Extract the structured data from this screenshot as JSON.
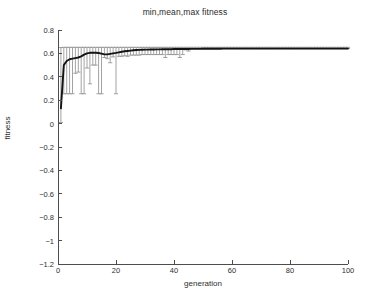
{
  "chart_data": {
    "type": "line",
    "title": "min,mean,max fitness",
    "xlabel": "generation",
    "ylabel": "fitness",
    "xlim": [
      0,
      100
    ],
    "ylim": [
      -1.2,
      0.8
    ],
    "xticks": [
      0,
      20,
      40,
      60,
      80,
      100
    ],
    "yticks": [
      0.8,
      0.6,
      0.4,
      0.2,
      0,
      -0.2,
      -0.4,
      -0.6,
      -0.8,
      -1,
      -1.2
    ],
    "ytick_labels": [
      "0.8",
      "0.6",
      "0.4",
      "0.2",
      "0",
      "−0.2",
      "−0.4",
      "−0.6",
      "−0.8",
      "−1",
      "−1.2"
    ],
    "xtick_labels": [
      "0",
      "20",
      "40",
      "60",
      "80",
      "100"
    ],
    "grid": false,
    "legend": null,
    "errorbar_marker": "+",
    "colors": {
      "mean_line": "#141414",
      "errorbar": "#8c8c8c",
      "axis": "#4d4d4d"
    },
    "x": [
      1,
      2,
      3,
      4,
      5,
      6,
      7,
      8,
      9,
      10,
      11,
      12,
      13,
      14,
      15,
      16,
      17,
      18,
      19,
      20,
      21,
      22,
      23,
      24,
      25,
      26,
      27,
      28,
      29,
      30,
      31,
      32,
      33,
      34,
      35,
      36,
      37,
      38,
      39,
      40,
      41,
      42,
      43,
      44,
      45,
      46,
      47,
      48,
      49,
      50,
      51,
      52,
      53,
      54,
      55,
      56,
      57,
      58,
      59,
      60,
      61,
      62,
      63,
      64,
      65,
      66,
      67,
      68,
      69,
      70,
      71,
      72,
      73,
      74,
      75,
      76,
      77,
      78,
      79,
      80,
      81,
      82,
      83,
      84,
      85,
      86,
      87,
      88,
      89,
      90,
      91,
      92,
      93,
      94,
      95,
      96,
      97,
      98,
      99,
      100
    ],
    "series": [
      {
        "name": "mean",
        "values": [
          0.13,
          0.5,
          0.535,
          0.55,
          0.555,
          0.56,
          0.565,
          0.575,
          0.59,
          0.6,
          0.605,
          0.607,
          0.606,
          0.603,
          0.598,
          0.592,
          0.592,
          0.596,
          0.6,
          0.604,
          0.609,
          0.614,
          0.618,
          0.621,
          0.624,
          0.627,
          0.629,
          0.63,
          0.631,
          0.632,
          0.632,
          0.633,
          0.633,
          0.634,
          0.634,
          0.635,
          0.635,
          0.636,
          0.636,
          0.637,
          0.637,
          0.637,
          0.638,
          0.638,
          0.638,
          0.639,
          0.639,
          0.639,
          0.639,
          0.64,
          0.64,
          0.64,
          0.64,
          0.64,
          0.64,
          0.64,
          0.641,
          0.641,
          0.641,
          0.641,
          0.641,
          0.641,
          0.641,
          0.641,
          0.641,
          0.641,
          0.641,
          0.641,
          0.641,
          0.641,
          0.641,
          0.641,
          0.641,
          0.641,
          0.641,
          0.641,
          0.641,
          0.641,
          0.641,
          0.641,
          0.641,
          0.641,
          0.641,
          0.641,
          0.641,
          0.641,
          0.641,
          0.641,
          0.641,
          0.641,
          0.641,
          0.641,
          0.641,
          0.641,
          0.641,
          0.641,
          0.641,
          0.641,
          0.641,
          0.641
        ]
      },
      {
        "name": "min",
        "values": [
          0.01,
          0.255,
          0.255,
          0.255,
          0.255,
          0.43,
          0.44,
          0.255,
          0.255,
          0.475,
          0.34,
          0.5,
          0.5,
          0.255,
          0.255,
          0.565,
          0.555,
          0.52,
          0.57,
          0.255,
          0.575,
          0.575,
          0.58,
          0.575,
          0.585,
          0.585,
          0.585,
          0.585,
          0.59,
          0.59,
          0.59,
          0.59,
          0.59,
          0.59,
          0.59,
          0.59,
          0.565,
          0.59,
          0.59,
          0.59,
          0.59,
          0.565,
          0.59,
          0.63,
          0.62,
          0.64,
          0.641,
          0.641,
          0.641,
          0.641,
          0.641,
          0.641,
          0.641,
          0.641,
          0.641,
          0.641,
          0.641,
          0.641,
          0.641,
          0.641,
          0.641,
          0.641,
          0.641,
          0.641,
          0.641,
          0.641,
          0.641,
          0.641,
          0.641,
          0.641,
          0.641,
          0.641,
          0.641,
          0.641,
          0.641,
          0.641,
          0.641,
          0.641,
          0.641,
          0.641,
          0.641,
          0.641,
          0.641,
          0.641,
          0.641,
          0.641,
          0.641,
          0.641,
          0.641,
          0.641,
          0.641,
          0.641,
          0.641,
          0.641,
          0.641,
          0.641,
          0.641,
          0.641,
          0.641,
          0.641
        ]
      },
      {
        "name": "max",
        "values": [
          0.65,
          0.652,
          0.652,
          0.652,
          0.652,
          0.652,
          0.652,
          0.652,
          0.652,
          0.652,
          0.652,
          0.652,
          0.652,
          0.652,
          0.652,
          0.652,
          0.652,
          0.652,
          0.652,
          0.652,
          0.652,
          0.652,
          0.652,
          0.652,
          0.652,
          0.652,
          0.652,
          0.652,
          0.652,
          0.652,
          0.652,
          0.652,
          0.652,
          0.652,
          0.652,
          0.652,
          0.652,
          0.652,
          0.652,
          0.652,
          0.652,
          0.652,
          0.652,
          0.652,
          0.652,
          0.652,
          0.652,
          0.652,
          0.652,
          0.652,
          0.652,
          0.652,
          0.652,
          0.652,
          0.652,
          0.652,
          0.652,
          0.652,
          0.652,
          0.652,
          0.652,
          0.652,
          0.652,
          0.652,
          0.652,
          0.652,
          0.652,
          0.652,
          0.652,
          0.652,
          0.652,
          0.652,
          0.652,
          0.652,
          0.652,
          0.652,
          0.652,
          0.652,
          0.652,
          0.652,
          0.652,
          0.652,
          0.652,
          0.652,
          0.652,
          0.652,
          0.652,
          0.652,
          0.652,
          0.652,
          0.652,
          0.652,
          0.652,
          0.652,
          0.652,
          0.652,
          0.652,
          0.652,
          0.652,
          0.652
        ]
      }
    ]
  }
}
